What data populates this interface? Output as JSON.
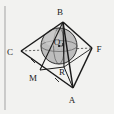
{
  "figure": {
    "background_color": "#f2f2f0",
    "stroke_color": "#1a1a1a",
    "sphere_fill": "#b9b9b9",
    "labels": {
      "B": "B",
      "C": "C",
      "F": "F",
      "A": "A",
      "M": "M",
      "R": "R",
      "O": "O"
    },
    "vertices": [
      {
        "name": "B",
        "label": "B",
        "x": 63,
        "y": 22
      },
      {
        "name": "C",
        "label": "C",
        "x": 21,
        "y": 51
      },
      {
        "name": "F",
        "label": "F",
        "x": 92,
        "y": 48
      },
      {
        "name": "A",
        "label": "A",
        "x": 73,
        "y": 88
      },
      {
        "name": "M",
        "label": "M",
        "x": 40,
        "y": 70
      },
      {
        "name": "R",
        "label": "R",
        "x": 64,
        "y": 67
      },
      {
        "name": "O",
        "label": "O",
        "x": 59,
        "y": 46
      }
    ],
    "label_positions": [
      {
        "name": "B",
        "label": "B",
        "x": 60,
        "y": 15
      },
      {
        "name": "C",
        "label": "C",
        "x": 10,
        "y": 55
      },
      {
        "name": "F",
        "label": "F",
        "x": 96,
        "y": 52
      },
      {
        "name": "A",
        "label": "A",
        "x": 70,
        "y": 102
      },
      {
        "name": "M",
        "label": "M",
        "x": 31,
        "y": 80
      },
      {
        "name": "R",
        "label": "R",
        "x": 61,
        "y": 74
      },
      {
        "name": "O",
        "label": "O",
        "x": 58,
        "y": 45
      }
    ],
    "sphere": {
      "center_x": 59,
      "center_y": 46,
      "radius": 18
    },
    "left_rule": {
      "x": 5,
      "y1": 6,
      "y2": 110
    }
  }
}
